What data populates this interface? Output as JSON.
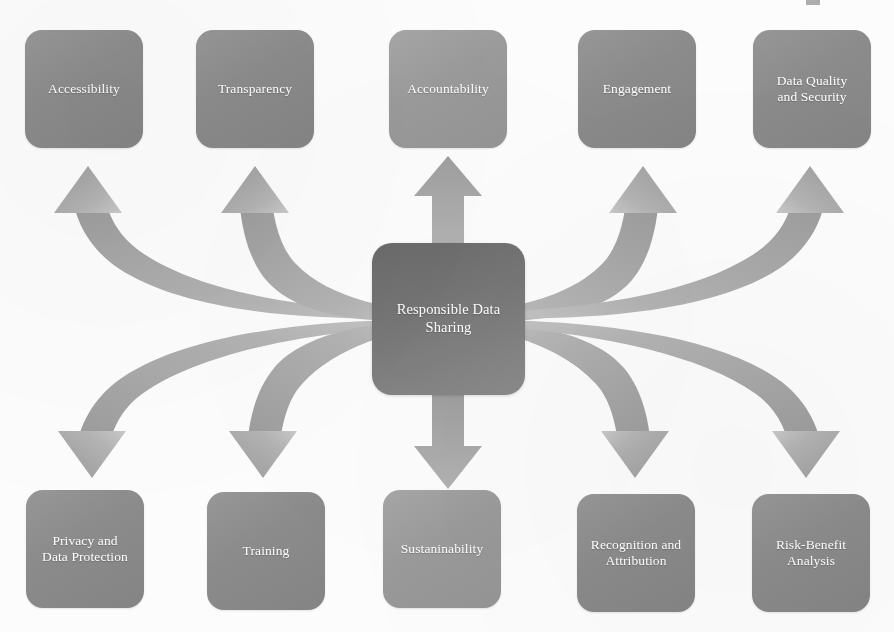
{
  "diagram": {
    "title": "Responsible Data Sharing",
    "type": "radial-hub-and-spoke",
    "background_color": "#fcfcfc",
    "node_color": "#8b8b8b",
    "node_color_light": "#9a9a9a",
    "center_color": "#7b7b7b",
    "arrow_color": "#9b9b9b",
    "label_color": "#ffffff"
  },
  "center": {
    "label": "Responsible Data Sharing",
    "line1": "Responsible Data",
    "line2": "Sharing"
  },
  "top_nodes": [
    {
      "id": "accessibility",
      "label": "Accessibility",
      "line1": "Accessibility",
      "line2": "",
      "tone": "normal"
    },
    {
      "id": "transparency",
      "label": "Transparency",
      "line1": "Transparency",
      "line2": "",
      "tone": "normal"
    },
    {
      "id": "accountability",
      "label": "Accountability",
      "line1": "Accountability",
      "line2": "",
      "tone": "light"
    },
    {
      "id": "engagement",
      "label": "Engagement",
      "line1": "Engagement",
      "line2": "",
      "tone": "normal"
    },
    {
      "id": "data-quality",
      "label": "Data Quality and Security",
      "line1": "Data Quality",
      "line2": "and Security",
      "tone": "normal"
    }
  ],
  "bottom_nodes": [
    {
      "id": "privacy",
      "label": "Privacy and Data Protection",
      "line1": "Privacy and",
      "line2": "Data Protection",
      "tone": "normal"
    },
    {
      "id": "training",
      "label": "Training",
      "line1": "Training",
      "line2": "",
      "tone": "normal"
    },
    {
      "id": "sustainability",
      "label": "Sustaninability",
      "line1": "Sustaninability",
      "line2": "",
      "tone": "light"
    },
    {
      "id": "recognition",
      "label": "Recognition and Attribution",
      "line1": "Recognition and",
      "line2": "Attribution",
      "tone": "normal"
    },
    {
      "id": "risk-benefit",
      "label": "Risk-Benefit Analysis",
      "line1": "Risk-Benefit",
      "line2": "Analysis",
      "tone": "normal"
    }
  ],
  "arrows": [
    {
      "id": "arrow-to-accessibility",
      "from": "center",
      "to": "accessibility",
      "shape": "curved",
      "direction": "up-left"
    },
    {
      "id": "arrow-to-transparency",
      "from": "center",
      "to": "transparency",
      "shape": "curved",
      "direction": "up-left"
    },
    {
      "id": "arrow-to-accountability",
      "from": "center",
      "to": "accountability",
      "shape": "straight",
      "direction": "up"
    },
    {
      "id": "arrow-to-engagement",
      "from": "center",
      "to": "engagement",
      "shape": "curved",
      "direction": "up-right"
    },
    {
      "id": "arrow-to-data-quality",
      "from": "center",
      "to": "data-quality",
      "shape": "curved",
      "direction": "up-right"
    },
    {
      "id": "arrow-to-privacy",
      "from": "center",
      "to": "privacy",
      "shape": "curved",
      "direction": "down-left"
    },
    {
      "id": "arrow-to-training",
      "from": "center",
      "to": "training",
      "shape": "curved",
      "direction": "down-left"
    },
    {
      "id": "arrow-to-sustainability",
      "from": "center",
      "to": "sustainability",
      "shape": "straight",
      "direction": "down"
    },
    {
      "id": "arrow-to-recognition",
      "from": "center",
      "to": "recognition",
      "shape": "curved",
      "direction": "down-right"
    },
    {
      "id": "arrow-to-risk-benefit",
      "from": "center",
      "to": "risk-benefit",
      "shape": "curved",
      "direction": "down-right"
    }
  ]
}
